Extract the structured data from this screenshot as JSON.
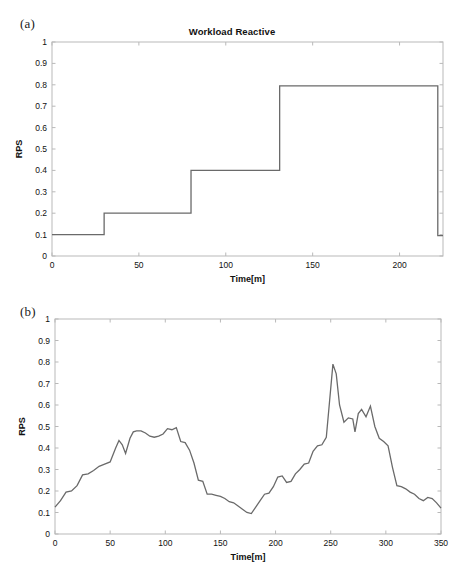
{
  "figure": {
    "panels": [
      {
        "tag": "(a)",
        "title": "Workload Reactive",
        "xlabel": "Time[m]",
        "ylabel": "RPS"
      },
      {
        "tag": "(b)",
        "title": "Workload Bimodal",
        "xlabel": "Time[m]",
        "ylabel": "RPS"
      }
    ]
  },
  "chart_data": [
    {
      "type": "line",
      "title": "Workload Reactive",
      "xlabel": "Time[m]",
      "ylabel": "RPS",
      "xlim": [
        0,
        225
      ],
      "ylim": [
        0,
        1
      ],
      "xticks": [
        0,
        50,
        100,
        150,
        200
      ],
      "xtick_labels": [
        "0",
        "50",
        "100",
        "150",
        "200"
      ],
      "yticks": [
        0,
        0.1,
        0.2,
        0.3,
        0.4,
        0.5,
        0.6,
        0.7,
        0.8,
        0.9,
        1
      ],
      "ytick_labels": [
        "0",
        "0.1",
        "0.2",
        "0.3",
        "0.4",
        "0.5",
        "0.6",
        "0.7",
        "0.8",
        "0.9",
        "1"
      ],
      "grid": false,
      "legend": null,
      "line_color": "#6a6a6a",
      "step_style": "post",
      "x": [
        0,
        30,
        30,
        80,
        80,
        131,
        131,
        222,
        222,
        225
      ],
      "y": [
        0.1,
        0.1,
        0.2,
        0.2,
        0.4,
        0.4,
        0.795,
        0.795,
        0.095,
        0.095
      ],
      "steps": [
        {
          "t_start": 0,
          "t_end": 30,
          "rps": 0.1
        },
        {
          "t_start": 30,
          "t_end": 80,
          "rps": 0.2
        },
        {
          "t_start": 80,
          "t_end": 131,
          "rps": 0.4
        },
        {
          "t_start": 131,
          "t_end": 222,
          "rps": 0.795
        },
        {
          "t_start": 222,
          "t_end": 225,
          "rps": 0.095
        }
      ]
    },
    {
      "type": "line",
      "title": "Workload Bimodal",
      "xlabel": "Time[m]",
      "ylabel": "RPS",
      "xlim": [
        0,
        350
      ],
      "ylim": [
        0,
        1
      ],
      "xticks": [
        0,
        50,
        100,
        150,
        200,
        250,
        300,
        350
      ],
      "xtick_labels": [
        "0",
        "50",
        "100",
        "150",
        "200",
        "250",
        "300",
        "350"
      ],
      "yticks": [
        0,
        0.1,
        0.2,
        0.3,
        0.4,
        0.5,
        0.6,
        0.7,
        0.8,
        0.9,
        1
      ],
      "ytick_labels": [
        "0",
        "0.1",
        "0.2",
        "0.3",
        "0.4",
        "0.5",
        "0.6",
        "0.7",
        "0.8",
        "0.9",
        "1"
      ],
      "grid": false,
      "legend": null,
      "line_color": "#6a6a6a",
      "x": [
        0,
        5,
        10,
        15,
        20,
        25,
        30,
        35,
        40,
        45,
        50,
        55,
        58,
        61,
        64,
        68,
        71,
        74,
        78,
        82,
        86,
        90,
        94,
        98,
        102,
        106,
        110,
        114,
        118,
        122,
        126,
        130,
        134,
        138,
        142,
        146,
        150,
        154,
        158,
        162,
        166,
        170,
        174,
        178,
        182,
        186,
        190,
        194,
        198,
        202,
        206,
        210,
        214,
        218,
        222,
        226,
        230,
        234,
        238,
        242,
        246,
        249,
        252,
        255,
        258,
        262,
        266,
        270,
        272,
        275,
        278,
        282,
        286,
        290,
        294,
        298,
        302,
        306,
        310,
        314,
        318,
        322,
        326,
        330,
        334,
        338,
        342,
        346,
        350
      ],
      "y": [
        0.125,
        0.155,
        0.195,
        0.2,
        0.225,
        0.275,
        0.28,
        0.295,
        0.315,
        0.325,
        0.335,
        0.4,
        0.435,
        0.415,
        0.375,
        0.445,
        0.475,
        0.48,
        0.48,
        0.47,
        0.455,
        0.45,
        0.455,
        0.465,
        0.49,
        0.485,
        0.495,
        0.43,
        0.425,
        0.39,
        0.33,
        0.25,
        0.245,
        0.185,
        0.185,
        0.18,
        0.175,
        0.165,
        0.15,
        0.145,
        0.13,
        0.115,
        0.1,
        0.095,
        0.125,
        0.155,
        0.185,
        0.19,
        0.22,
        0.265,
        0.27,
        0.24,
        0.245,
        0.28,
        0.3,
        0.325,
        0.33,
        0.385,
        0.41,
        0.415,
        0.45,
        0.62,
        0.79,
        0.745,
        0.6,
        0.52,
        0.54,
        0.535,
        0.475,
        0.56,
        0.58,
        0.545,
        0.595,
        0.5,
        0.445,
        0.43,
        0.41,
        0.31,
        0.225,
        0.22,
        0.21,
        0.195,
        0.185,
        0.165,
        0.155,
        0.17,
        0.165,
        0.145,
        0.12
      ]
    }
  ]
}
